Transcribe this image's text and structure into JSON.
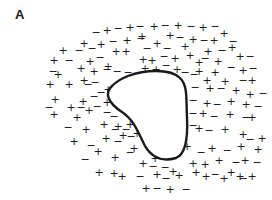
{
  "figure": {
    "panel_label": "A",
    "colors": {
      "ink": "#1a1a1a",
      "background": "#ffffff"
    },
    "particle": {
      "shape": "rounded-triangle",
      "path": "M 112 86 C 104 93, 108 103, 122 112 C 134 120, 138 132, 145 146 C 152 158, 162 162, 176 158 C 186 154, 188 138, 187 118 C 186 98, 188 86, 180 78 C 170 68, 144 70, 128 76 C 120 79, 116 82, 112 86 Z"
    },
    "charges": [
      {
        "s": "−",
        "x": 96,
        "y": 32
      },
      {
        "s": "+",
        "x": 107,
        "y": 30
      },
      {
        "s": "−",
        "x": 118,
        "y": 28
      },
      {
        "s": "+",
        "x": 130,
        "y": 27
      },
      {
        "s": "−",
        "x": 140,
        "y": 26
      },
      {
        "s": "+",
        "x": 154,
        "y": 26
      },
      {
        "s": "−",
        "x": 165,
        "y": 25
      },
      {
        "s": "+",
        "x": 178,
        "y": 25
      },
      {
        "s": "−",
        "x": 191,
        "y": 26
      },
      {
        "s": "+",
        "x": 203,
        "y": 27
      },
      {
        "s": "−",
        "x": 215,
        "y": 26
      },
      {
        "s": "+",
        "x": 84,
        "y": 43
      },
      {
        "s": "−",
        "x": 79,
        "y": 50
      },
      {
        "s": "−",
        "x": 92,
        "y": 48
      },
      {
        "s": "+",
        "x": 101,
        "y": 44
      },
      {
        "s": "−",
        "x": 113,
        "y": 41
      },
      {
        "s": "+",
        "x": 127,
        "y": 40
      },
      {
        "s": "−",
        "x": 141,
        "y": 38
      },
      {
        "s": "+",
        "x": 142,
        "y": 36
      },
      {
        "s": "+",
        "x": 170,
        "y": 35
      },
      {
        "s": "−",
        "x": 180,
        "y": 37
      },
      {
        "s": "+",
        "x": 193,
        "y": 39
      },
      {
        "s": "−",
        "x": 204,
        "y": 40
      },
      {
        "s": "+",
        "x": 214,
        "y": 40
      },
      {
        "s": "+",
        "x": 224,
        "y": 33
      },
      {
        "s": "−",
        "x": 233,
        "y": 41
      },
      {
        "s": "+",
        "x": 63,
        "y": 50
      },
      {
        "s": "+",
        "x": 54,
        "y": 60
      },
      {
        "s": "−",
        "x": 69,
        "y": 60
      },
      {
        "s": "+",
        "x": 90,
        "y": 61
      },
      {
        "s": "−",
        "x": 100,
        "y": 57
      },
      {
        "s": "+",
        "x": 116,
        "y": 51
      },
      {
        "s": "+",
        "x": 126,
        "y": 51
      },
      {
        "s": "−",
        "x": 147,
        "y": 48
      },
      {
        "s": "+",
        "x": 157,
        "y": 43
      },
      {
        "s": "−",
        "x": 167,
        "y": 48
      },
      {
        "s": "+",
        "x": 185,
        "y": 46
      },
      {
        "s": "+",
        "x": 208,
        "y": 51
      },
      {
        "s": "−",
        "x": 222,
        "y": 50
      },
      {
        "s": "+",
        "x": 232,
        "y": 47
      },
      {
        "s": "−",
        "x": 53,
        "y": 71
      },
      {
        "s": "+",
        "x": 58,
        "y": 74
      },
      {
        "s": "+",
        "x": 81,
        "y": 68
      },
      {
        "s": "+",
        "x": 94,
        "y": 71
      },
      {
        "s": "−",
        "x": 107,
        "y": 69
      },
      {
        "s": "+",
        "x": 108,
        "y": 66
      },
      {
        "s": "−",
        "x": 117,
        "y": 71
      },
      {
        "s": "−",
        "x": 128,
        "y": 72
      },
      {
        "s": "+",
        "x": 143,
        "y": 59
      },
      {
        "s": "+",
        "x": 152,
        "y": 60
      },
      {
        "s": "−",
        "x": 164,
        "y": 56
      },
      {
        "s": "+",
        "x": 175,
        "y": 58
      },
      {
        "s": "+",
        "x": 190,
        "y": 55
      },
      {
        "s": "−",
        "x": 205,
        "y": 58
      },
      {
        "s": "+",
        "x": 218,
        "y": 61
      },
      {
        "s": "+",
        "x": 240,
        "y": 56
      },
      {
        "s": "−",
        "x": 250,
        "y": 56
      },
      {
        "s": "+",
        "x": 50,
        "y": 84
      },
      {
        "s": "+",
        "x": 69,
        "y": 84
      },
      {
        "s": "−",
        "x": 88,
        "y": 84
      },
      {
        "s": "+",
        "x": 84,
        "y": 80
      },
      {
        "s": "−",
        "x": 95,
        "y": 82
      },
      {
        "s": "+",
        "x": 145,
        "y": 68
      },
      {
        "s": "+",
        "x": 156,
        "y": 69
      },
      {
        "s": "−",
        "x": 166,
        "y": 65
      },
      {
        "s": "+",
        "x": 177,
        "y": 69
      },
      {
        "s": "−",
        "x": 185,
        "y": 72
      },
      {
        "s": "+",
        "x": 199,
        "y": 62
      },
      {
        "s": "+",
        "x": 215,
        "y": 72
      },
      {
        "s": "−",
        "x": 231,
        "y": 67
      },
      {
        "s": "+",
        "x": 243,
        "y": 70
      },
      {
        "s": "−",
        "x": 253,
        "y": 68
      },
      {
        "s": "+",
        "x": 55,
        "y": 99
      },
      {
        "s": "−",
        "x": 49,
        "y": 107
      },
      {
        "s": "+",
        "x": 71,
        "y": 107
      },
      {
        "s": "−",
        "x": 81,
        "y": 107
      },
      {
        "s": "+",
        "x": 83,
        "y": 101
      },
      {
        "s": "−",
        "x": 94,
        "y": 96
      },
      {
        "s": "−",
        "x": 101,
        "y": 92
      },
      {
        "s": "+",
        "x": 108,
        "y": 89
      },
      {
        "s": "−",
        "x": 194,
        "y": 74
      },
      {
        "s": "+",
        "x": 199,
        "y": 71
      },
      {
        "s": "+",
        "x": 207,
        "y": 80
      },
      {
        "s": "+",
        "x": 225,
        "y": 81
      },
      {
        "s": "−",
        "x": 243,
        "y": 80
      },
      {
        "s": "+",
        "x": 252,
        "y": 80
      },
      {
        "s": "+",
        "x": 54,
        "y": 114
      },
      {
        "s": "+",
        "x": 77,
        "y": 117
      },
      {
        "s": "+",
        "x": 89,
        "y": 110
      },
      {
        "s": "−",
        "x": 97,
        "y": 106
      },
      {
        "s": "+",
        "x": 107,
        "y": 102
      },
      {
        "s": "−",
        "x": 107,
        "y": 112
      },
      {
        "s": "−",
        "x": 114,
        "y": 116
      },
      {
        "s": "−",
        "x": 195,
        "y": 87
      },
      {
        "s": "+",
        "x": 210,
        "y": 88
      },
      {
        "s": "−",
        "x": 221,
        "y": 88
      },
      {
        "s": "+",
        "x": 236,
        "y": 90
      },
      {
        "s": "+",
        "x": 250,
        "y": 94
      },
      {
        "s": "−",
        "x": 263,
        "y": 93
      },
      {
        "s": "−",
        "x": 68,
        "y": 127
      },
      {
        "s": "+",
        "x": 86,
        "y": 129
      },
      {
        "s": "+",
        "x": 104,
        "y": 124
      },
      {
        "s": "−",
        "x": 115,
        "y": 129
      },
      {
        "s": "+",
        "x": 118,
        "y": 126
      },
      {
        "s": "−",
        "x": 126,
        "y": 129
      },
      {
        "s": "+",
        "x": 130,
        "y": 124
      },
      {
        "s": "−",
        "x": 193,
        "y": 100
      },
      {
        "s": "+",
        "x": 207,
        "y": 103
      },
      {
        "s": "−",
        "x": 217,
        "y": 104
      },
      {
        "s": "+",
        "x": 231,
        "y": 101
      },
      {
        "s": "+",
        "x": 246,
        "y": 104
      },
      {
        "s": "−",
        "x": 258,
        "y": 106
      },
      {
        "s": "+",
        "x": 74,
        "y": 141
      },
      {
        "s": "−",
        "x": 91,
        "y": 145
      },
      {
        "s": "+",
        "x": 106,
        "y": 138
      },
      {
        "s": "−",
        "x": 118,
        "y": 141
      },
      {
        "s": "+",
        "x": 123,
        "y": 135
      },
      {
        "s": "−",
        "x": 131,
        "y": 136
      },
      {
        "s": "+",
        "x": 137,
        "y": 133
      },
      {
        "s": "−",
        "x": 193,
        "y": 113
      },
      {
        "s": "+",
        "x": 203,
        "y": 113
      },
      {
        "s": "−",
        "x": 214,
        "y": 116
      },
      {
        "s": "+",
        "x": 230,
        "y": 114
      },
      {
        "s": "−",
        "x": 246,
        "y": 117
      },
      {
        "s": "+",
        "x": 252,
        "y": 117
      },
      {
        "s": "−",
        "x": 85,
        "y": 159
      },
      {
        "s": "+",
        "x": 98,
        "y": 151
      },
      {
        "s": "+",
        "x": 115,
        "y": 157
      },
      {
        "s": "−",
        "x": 130,
        "y": 152
      },
      {
        "s": "+",
        "x": 134,
        "y": 148
      },
      {
        "s": "−",
        "x": 193,
        "y": 125
      },
      {
        "s": "+",
        "x": 199,
        "y": 128
      },
      {
        "s": "−",
        "x": 209,
        "y": 130
      },
      {
        "s": "+",
        "x": 225,
        "y": 129
      },
      {
        "s": "+",
        "x": 243,
        "y": 134
      },
      {
        "s": "−",
        "x": 250,
        "y": 139
      },
      {
        "s": "+",
        "x": 262,
        "y": 138
      },
      {
        "s": "+",
        "x": 99,
        "y": 172
      },
      {
        "s": "+",
        "x": 114,
        "y": 173
      },
      {
        "s": "+",
        "x": 143,
        "y": 163
      },
      {
        "s": "+",
        "x": 155,
        "y": 158
      },
      {
        "s": "−",
        "x": 153,
        "y": 166
      },
      {
        "s": "+",
        "x": 173,
        "y": 171
      },
      {
        "s": "−",
        "x": 165,
        "y": 167
      },
      {
        "s": "+",
        "x": 187,
        "y": 146
      },
      {
        "s": "−",
        "x": 201,
        "y": 152
      },
      {
        "s": "+",
        "x": 212,
        "y": 148
      },
      {
        "s": "−",
        "x": 227,
        "y": 150
      },
      {
        "s": "+",
        "x": 241,
        "y": 146
      },
      {
        "s": "+",
        "x": 258,
        "y": 149
      },
      {
        "s": "+",
        "x": 122,
        "y": 176
      },
      {
        "s": "−",
        "x": 140,
        "y": 176
      },
      {
        "s": "+",
        "x": 157,
        "y": 174
      },
      {
        "s": "−",
        "x": 166,
        "y": 178
      },
      {
        "s": "+",
        "x": 179,
        "y": 175
      },
      {
        "s": "+",
        "x": 193,
        "y": 163
      },
      {
        "s": "+",
        "x": 205,
        "y": 164
      },
      {
        "s": "+",
        "x": 219,
        "y": 160
      },
      {
        "s": "−",
        "x": 236,
        "y": 162
      },
      {
        "s": "+",
        "x": 245,
        "y": 160
      },
      {
        "s": "−",
        "x": 257,
        "y": 162
      },
      {
        "s": "+",
        "x": 146,
        "y": 188
      },
      {
        "s": "−",
        "x": 157,
        "y": 188
      },
      {
        "s": "+",
        "x": 170,
        "y": 189
      },
      {
        "s": "−",
        "x": 186,
        "y": 189
      },
      {
        "s": "+",
        "x": 196,
        "y": 172
      },
      {
        "s": "+",
        "x": 206,
        "y": 176
      },
      {
        "s": "−",
        "x": 215,
        "y": 174
      },
      {
        "s": "+",
        "x": 224,
        "y": 178
      },
      {
        "s": "+",
        "x": 231,
        "y": 172
      },
      {
        "s": "+",
        "x": 240,
        "y": 176
      },
      {
        "s": "−",
        "x": 243,
        "y": 178
      },
      {
        "s": "+",
        "x": 252,
        "y": 176
      }
    ]
  }
}
